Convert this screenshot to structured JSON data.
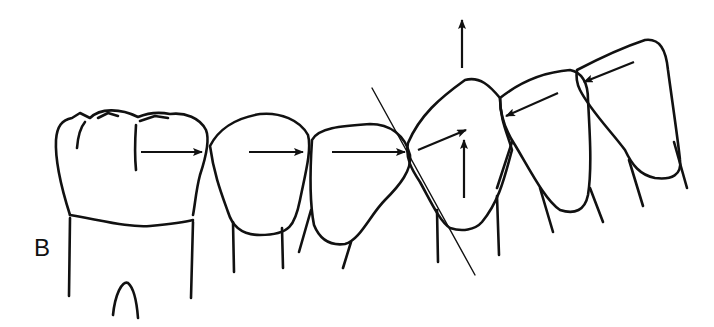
{
  "figure": {
    "panel_label": "B",
    "colors": {
      "line": "#111111",
      "background": "#ffffff"
    },
    "teeth": [
      {
        "name": "molar",
        "arrow": "mesial-right"
      },
      {
        "name": "second-premolar",
        "arrow": "mesial-right"
      },
      {
        "name": "first-premolar",
        "arrow": "mesial-right"
      },
      {
        "name": "canine",
        "arrow": "up-and-diagonal"
      },
      {
        "name": "lateral-incisor",
        "arrow": "distal-left"
      },
      {
        "name": "central-incisor",
        "arrow": "distal-left"
      }
    ],
    "annotations": [
      {
        "type": "reference-line",
        "name": "contact-plane-line"
      },
      {
        "type": "arrow",
        "name": "extrusion-arrow",
        "direction": "up"
      }
    ]
  }
}
